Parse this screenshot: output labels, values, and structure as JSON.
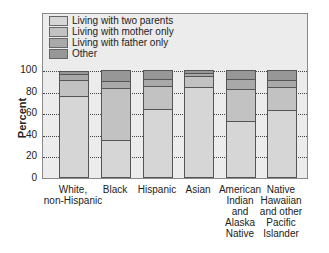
{
  "chart_data": {
    "type": "bar",
    "stacked": true,
    "title": "",
    "xlabel": "",
    "ylabel": "Percent",
    "ylim": [
      0,
      100
    ],
    "yticks": [
      0,
      20,
      40,
      60,
      80,
      100
    ],
    "grid": true,
    "legend_position": "top-left inside",
    "categories": [
      "White, non-Hispanic",
      "Black",
      "Hispanic",
      "Asian",
      "American Indian and Alaska Native",
      "Native Hawaiian and other Pacific Islander"
    ],
    "category_display": [
      "White,\nnon-Hispanic",
      "Black",
      "Hispanic",
      "Asian",
      "American\nIndian\nand\nAlaska\nNative",
      "Native\nHawaiian\nand other\nPacific\nIslander"
    ],
    "series": [
      {
        "name": "Living with two parents",
        "color": "#d6d6d6",
        "values": [
          76,
          35,
          64,
          84,
          53,
          63
        ]
      },
      {
        "name": "Living with mother only",
        "color": "#c2c2c2",
        "values": [
          15,
          48,
          21,
          10,
          29,
          21
        ]
      },
      {
        "name": "Living with father only",
        "color": "#a9a9a9",
        "values": [
          5,
          7,
          7,
          3,
          10,
          7
        ]
      },
      {
        "name": "Other",
        "color": "#979797",
        "values": [
          3,
          10,
          8,
          3,
          8,
          9
        ]
      }
    ]
  }
}
